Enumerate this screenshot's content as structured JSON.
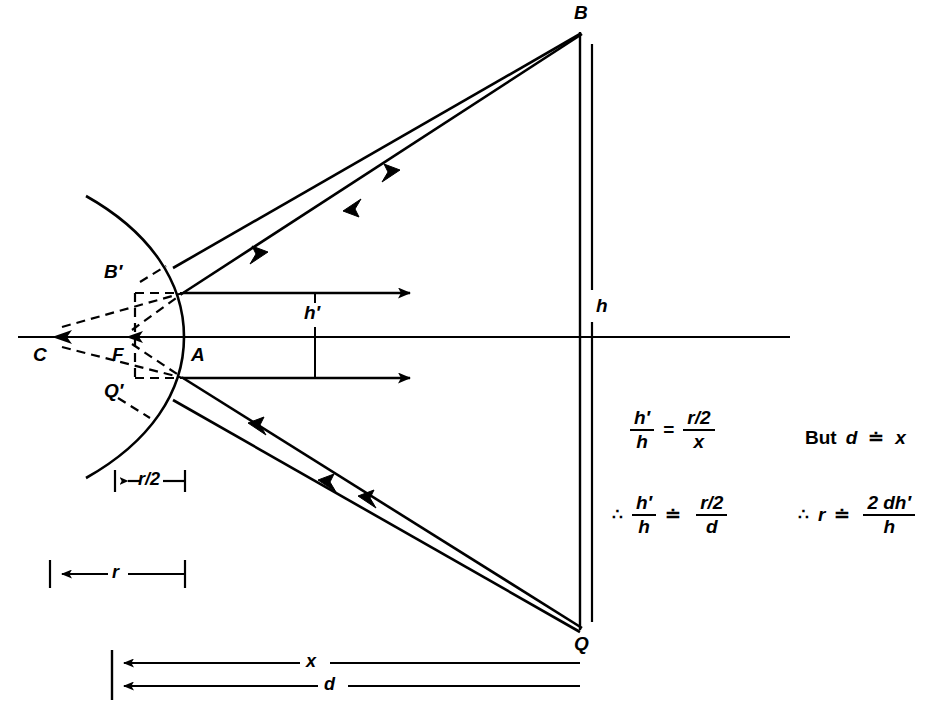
{
  "figure": {
    "kind": "concave-mirror-ray-diagram",
    "background": "#ffffff",
    "ink": "#000000"
  },
  "points": {
    "B": {
      "label": "B",
      "x": 580,
      "y": 32,
      "desc": "object top"
    },
    "Q": {
      "label": "Q",
      "x": 580,
      "y": 630,
      "desc": "object bottom"
    },
    "A": {
      "label": "A",
      "x": 184,
      "y": 337,
      "desc": "mirror vertex"
    },
    "C": {
      "label": "C",
      "x": 50,
      "y": 337,
      "desc": "centre of curvature"
    },
    "F": {
      "label": "F",
      "x": 128,
      "y": 337,
      "desc": "focal point"
    },
    "Bp": {
      "label": "B'",
      "x": 135,
      "y": 293,
      "desc": "image top"
    },
    "Qp": {
      "label": "Q'",
      "x": 135,
      "y": 378,
      "desc": "image bottom"
    }
  },
  "labels": {
    "B": "B",
    "Q": "Q",
    "A": "A",
    "C": "C",
    "F": "F",
    "B_prime": "B′",
    "Q_prime": "Q′",
    "h": "h",
    "h_prime": "h′",
    "r_half": "r/2",
    "r": "r",
    "x": "x",
    "d": "d"
  },
  "dimensions": [
    {
      "name": "r-over-2",
      "label": "r/2",
      "from_x": 115,
      "to_x": 185,
      "y": 480
    },
    {
      "name": "r",
      "label": "r",
      "from_x": 50,
      "to_x": 185,
      "y": 573
    },
    {
      "name": "x",
      "label": "x",
      "from_x": 112,
      "to_x": 580,
      "y": 664
    },
    {
      "name": "d",
      "label": "d",
      "from_x": 112,
      "to_x": 580,
      "y": 686
    },
    {
      "name": "h",
      "label": "h",
      "x": 592,
      "from_y": 32,
      "to_y": 630
    },
    {
      "name": "h-prime",
      "label": "h′",
      "x": 315,
      "from_y": 293,
      "to_y": 378
    }
  ],
  "equations": {
    "eq1": {
      "name": "similar-triangles-ratio",
      "lhs_num": "h′",
      "lhs_den": "h",
      "relation": "=",
      "rhs_num": "r/2",
      "rhs_den": "x",
      "text": "h′/h = (r/2)/x"
    },
    "eq2": {
      "name": "approximation-d-equals-x",
      "prefix": "But",
      "left": "d",
      "relation": "≐",
      "right": "x",
      "text": "But d ≐ x"
    },
    "eq3": {
      "name": "ratio-with-d",
      "therefore": "∴",
      "lhs_num": "h′",
      "lhs_den": "h",
      "relation": "≐",
      "rhs_num": "r/2",
      "rhs_den": "d",
      "text": "∴ h′/h ≐ (r/2)/d"
    },
    "eq4": {
      "name": "solve-for-r",
      "therefore": "∴",
      "left": "r",
      "relation": "≐",
      "rhs_num": "2 dh′",
      "rhs_den": "h",
      "text": "∴ r ≐ 2dh′/h"
    }
  }
}
